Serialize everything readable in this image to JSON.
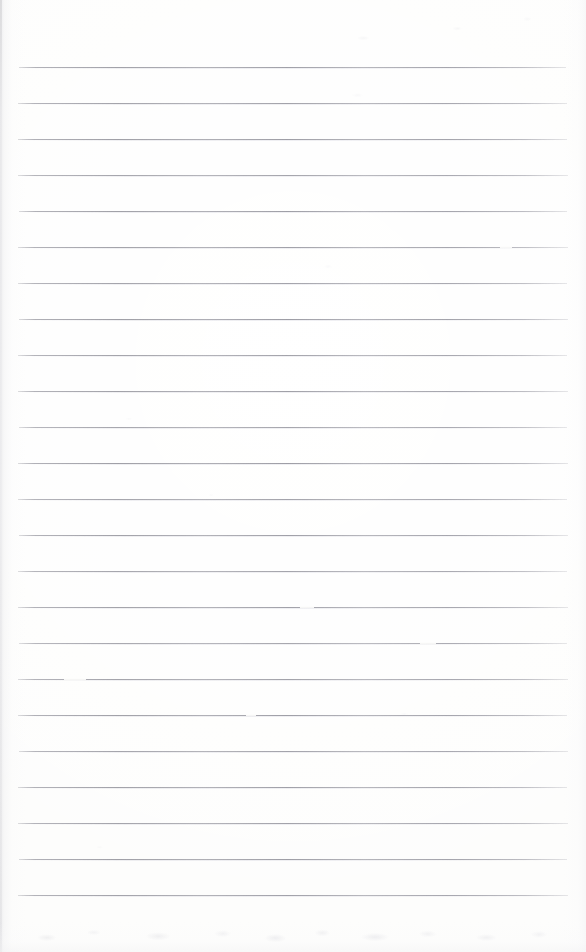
{
  "document": {
    "kind": "scanned-page",
    "description": "Blank ruled notebook page, scanned",
    "title": "",
    "page_width": 586,
    "page_height": 952,
    "handwriting_present": false,
    "text_content": "",
    "paper_color": "#fdfdfc",
    "rule_color": "#96969e",
    "edge_shadow_color": "#e4e4e6"
  },
  "ruling": {
    "style": "wide-ruled-horizontal",
    "line_count": 24,
    "line_thickness_px": 1,
    "line_spacing_px": 36,
    "first_line_y": 67,
    "last_line_y": 895,
    "margin_left_px": 18,
    "margin_right_px": 568,
    "line_length_px": 550,
    "vertical_margin_rule": false,
    "top_blank_margin_px": 67,
    "bottom_blank_margin_px": 57,
    "lines": [
      {
        "index": 1,
        "y": 67,
        "x_start": 19,
        "x_end": 566,
        "opacity": 0.88
      },
      {
        "index": 2,
        "y": 103,
        "x_start": 18,
        "x_end": 567,
        "opacity": 0.86
      },
      {
        "index": 3,
        "y": 139,
        "x_start": 18,
        "x_end": 567,
        "opacity": 0.9
      },
      {
        "index": 4,
        "y": 175,
        "x_start": 18,
        "x_end": 568,
        "opacity": 0.84
      },
      {
        "index": 5,
        "y": 211,
        "x_start": 19,
        "x_end": 567,
        "opacity": 0.89
      },
      {
        "index": 6,
        "y": 247,
        "x_start": 18,
        "x_end": 568,
        "opacity": 0.87
      },
      {
        "index": 7,
        "y": 283,
        "x_start": 18,
        "x_end": 567,
        "opacity": 0.85
      },
      {
        "index": 8,
        "y": 319,
        "x_start": 19,
        "x_end": 568,
        "opacity": 0.91
      },
      {
        "index": 9,
        "y": 355,
        "x_start": 18,
        "x_end": 567,
        "opacity": 0.86
      },
      {
        "index": 10,
        "y": 391,
        "x_start": 18,
        "x_end": 568,
        "opacity": 0.88
      },
      {
        "index": 11,
        "y": 427,
        "x_start": 19,
        "x_end": 567,
        "opacity": 0.83
      },
      {
        "index": 12,
        "y": 463,
        "x_start": 18,
        "x_end": 568,
        "opacity": 0.9
      },
      {
        "index": 13,
        "y": 499,
        "x_start": 18,
        "x_end": 567,
        "opacity": 0.85
      },
      {
        "index": 14,
        "y": 535,
        "x_start": 19,
        "x_end": 568,
        "opacity": 0.88
      },
      {
        "index": 15,
        "y": 571,
        "x_start": 18,
        "x_end": 567,
        "opacity": 0.84
      },
      {
        "index": 16,
        "y": 607,
        "x_start": 18,
        "x_end": 568,
        "opacity": 0.87
      },
      {
        "index": 17,
        "y": 643,
        "x_start": 19,
        "x_end": 567,
        "opacity": 0.82
      },
      {
        "index": 18,
        "y": 679,
        "x_start": 18,
        "x_end": 568,
        "opacity": 0.86
      },
      {
        "index": 19,
        "y": 715,
        "x_start": 18,
        "x_end": 567,
        "opacity": 0.89
      },
      {
        "index": 20,
        "y": 751,
        "x_start": 19,
        "x_end": 568,
        "opacity": 0.85
      },
      {
        "index": 21,
        "y": 787,
        "x_start": 18,
        "x_end": 567,
        "opacity": 0.88
      },
      {
        "index": 22,
        "y": 823,
        "x_start": 18,
        "x_end": 568,
        "opacity": 0.86
      },
      {
        "index": 23,
        "y": 859,
        "x_start": 19,
        "x_end": 567,
        "opacity": 0.9
      },
      {
        "index": 24,
        "y": 895,
        "x_start": 18,
        "x_end": 568,
        "opacity": 0.87
      }
    ],
    "dropouts": [
      {
        "line_index": 16,
        "x": 300,
        "width": 14
      },
      {
        "line_index": 17,
        "x": 420,
        "width": 16
      },
      {
        "line_index": 18,
        "x": 64,
        "width": 22
      },
      {
        "line_index": 19,
        "x": 246,
        "width": 10
      },
      {
        "line_index": 6,
        "x": 500,
        "width": 12
      }
    ]
  },
  "artifacts": {
    "left_edge_shadow": true,
    "right_edge_shadow": true,
    "bottom_edge_smudge": true,
    "scan_speckle": true
  }
}
